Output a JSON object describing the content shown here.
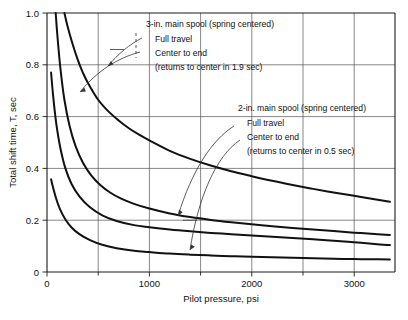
{
  "chart_data": {
    "type": "line",
    "title": "",
    "xlabel": "Pilot pressure, psi",
    "ylabel": "Total shift time, T, sec",
    "xlim": [
      0,
      3400
    ],
    "ylim": [
      0,
      1.0
    ],
    "grid": true,
    "legend_position": "inline-annotations",
    "xticks": [
      0,
      1000,
      2000,
      3000
    ],
    "xtick_labels": [
      "0",
      "1000",
      "2000",
      "3000"
    ],
    "xgridlines": [
      500,
      1000,
      1500,
      2000,
      2500,
      3000
    ],
    "yticks": [
      0,
      0.2,
      0.4,
      0.6,
      0.8,
      1.0
    ],
    "ytick_labels": [
      "0",
      "0.2",
      "0.4",
      "0.6",
      "0.8",
      "1.0"
    ],
    "ygridlines": [
      0.2,
      0.4,
      0.6,
      0.8
    ],
    "series": [
      {
        "name": "3-in. main spool (spring centered) — Full travel",
        "x": [
          170,
          200,
          250,
          300,
          350,
          400,
          500,
          600,
          700,
          800,
          900,
          1000,
          1200,
          1400,
          1600,
          1800,
          2000,
          2200,
          2400,
          2600,
          2800,
          3000,
          3200,
          3350
        ],
        "y": [
          1.0,
          0.95,
          0.88,
          0.82,
          0.77,
          0.73,
          0.665,
          0.62,
          0.585,
          0.555,
          0.53,
          0.508,
          0.468,
          0.437,
          0.411,
          0.389,
          0.37,
          0.352,
          0.336,
          0.321,
          0.307,
          0.294,
          0.281,
          0.271
        ]
      },
      {
        "name": "3-in. main spool (spring centered) — Center to end",
        "x": [
          85,
          100,
          130,
          170,
          220,
          280,
          350,
          430,
          520,
          620,
          720,
          850,
          1000,
          1200,
          1400,
          1600,
          1800,
          2000,
          2200,
          2400,
          2600,
          2800,
          3000,
          3200,
          3350
        ],
        "y": [
          1.0,
          0.92,
          0.79,
          0.665,
          0.565,
          0.485,
          0.423,
          0.374,
          0.336,
          0.306,
          0.284,
          0.263,
          0.245,
          0.226,
          0.212,
          0.201,
          0.192,
          0.184,
          0.177,
          0.17,
          0.164,
          0.158,
          0.152,
          0.147,
          0.143
        ]
      },
      {
        "name": "2-in. main spool (spring centered) — Full travel",
        "x": [
          40,
          60,
          90,
          130,
          180,
          240,
          320,
          420,
          540,
          680,
          850,
          1000,
          1200,
          1400,
          1600,
          1800,
          2000,
          2200,
          2400,
          2600,
          2800,
          3000,
          3200,
          3350
        ],
        "y": [
          0.77,
          0.68,
          0.575,
          0.48,
          0.4,
          0.34,
          0.29,
          0.25,
          0.219,
          0.197,
          0.181,
          0.173,
          0.164,
          0.157,
          0.151,
          0.146,
          0.141,
          0.136,
          0.131,
          0.126,
          0.121,
          0.115,
          0.108,
          0.104
        ]
      },
      {
        "name": "2-in. main spool (spring centered) — Center to end",
        "x": [
          40,
          60,
          90,
          130,
          180,
          240,
          320,
          420,
          540,
          680,
          850,
          1000,
          1200,
          1400,
          1600,
          1800,
          2000,
          2200,
          2400,
          2600,
          2800,
          3000,
          3200,
          3350
        ],
        "y": [
          0.358,
          0.325,
          0.283,
          0.24,
          0.203,
          0.172,
          0.145,
          0.123,
          0.105,
          0.092,
          0.082,
          0.077,
          0.071,
          0.067,
          0.064,
          0.061,
          0.059,
          0.057,
          0.055,
          0.053,
          0.051,
          0.05,
          0.049,
          0.048
        ]
      }
    ],
    "annotations": [
      {
        "id": "annot-3in",
        "lines": [
          "3-in. main spool (spring centered)",
          "Full travel",
          "Center to end",
          "(returns to center in 1.9 sec)"
        ]
      },
      {
        "id": "annot-2in",
        "lines": [
          "2-in. main spool (spring centered)",
          "Full travel",
          "Center to end",
          "(returns to center in 0.5 sec)"
        ]
      }
    ]
  },
  "axes": {
    "x_title": "Pilot pressure, psi",
    "y_title": "Total shift time, T, sec"
  },
  "labels": {
    "y0": "0",
    "y1": "0.2",
    "y2": "0.4",
    "y3": "0.6",
    "y4": "0.8",
    "y5": "1.0",
    "x0": "0",
    "x1": "1000",
    "x2": "2000",
    "x3": "3000"
  },
  "annot_3in": {
    "l1": "3-in. main spool (spring centered)",
    "l2": "Full travel",
    "l3": "Center to end",
    "l4": "(returns to center in 1.9 sec)"
  },
  "annot_2in": {
    "l1": "2-in. main spool (spring centered)",
    "l2": "Full travel",
    "l3": "Center to end",
    "l4": "(returns to center in 0.5 sec)"
  },
  "colors": {
    "curve": "#111111",
    "grid": "#555555",
    "axis": "#1a1a1a",
    "background": "#ffffff"
  }
}
